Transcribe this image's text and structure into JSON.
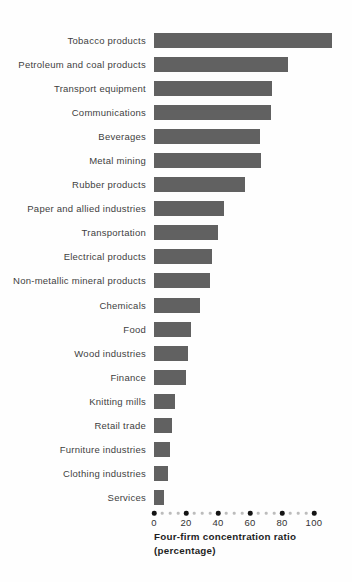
{
  "chart_data": {
    "type": "bar",
    "orientation": "horizontal",
    "title": "",
    "xlabel_line1": "Four-firm concentration ratio",
    "xlabel_line2": "(percentage)",
    "ylabel": "",
    "categories": [
      "Tobacco products",
      "Petroleum and coal products",
      "Transport equipment",
      "Communications",
      "Beverages",
      "Metal mining",
      "Rubber products",
      "Paper and allied industries",
      "Transportation",
      "Electrical products",
      "Non-metallic mineral products",
      "Chemicals",
      "Food",
      "Wood industries",
      "Finance",
      "Knitting mills",
      "Retail trade",
      "Furniture industries",
      "Clothing industries",
      "Services"
    ],
    "values": [
      111,
      84,
      74,
      73,
      66,
      67,
      57,
      44,
      40,
      36,
      35,
      29,
      23,
      21,
      20,
      13,
      11,
      10,
      9,
      6
    ],
    "xlim": [
      0,
      100
    ],
    "xticks": [
      0,
      20,
      40,
      60,
      80,
      100
    ],
    "x_minor_step": 5,
    "grid": false,
    "legend": "none",
    "bar_color": "#616161",
    "major_dot_color": "#141414",
    "minor_dot_color": "#bcbcbc",
    "label_text_color": "#3f3f3f",
    "px_per_unit": 1.6
  }
}
